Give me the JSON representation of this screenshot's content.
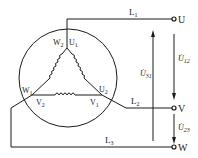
{
  "diagram": {
    "type": "three-phase delta connection",
    "colors": {
      "line": "#1a1a1a",
      "background": "#ffffff"
    },
    "lines": [
      {
        "name": "L",
        "sub": "1"
      },
      {
        "name": "L",
        "sub": "2"
      },
      {
        "name": "L",
        "sub": "3"
      }
    ],
    "terminals": [
      "U",
      "V",
      "W"
    ],
    "winding_labels": {
      "top_left": {
        "name": "W",
        "sub": "2"
      },
      "top_right": {
        "name": "U",
        "sub": "1"
      },
      "left": {
        "name": "W",
        "sub": "1"
      },
      "bottom_left": {
        "name": "V",
        "sub": "2"
      },
      "bottom_right": {
        "name": "V",
        "sub": "1"
      },
      "right": {
        "name": "U",
        "sub": "2"
      }
    },
    "voltages": [
      {
        "name": "U̇",
        "sub": "12"
      },
      {
        "name": "U̇",
        "sub": "23"
      },
      {
        "name": "U̇",
        "sub": "31"
      }
    ]
  }
}
